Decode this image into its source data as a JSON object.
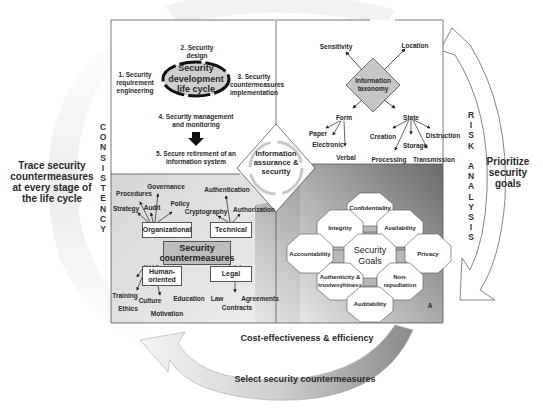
{
  "outer_arrows": {
    "left": {
      "vertical_label": "CONSISTENCY",
      "side_text": "Trace security countermeasures at every stage of the life cycle"
    },
    "right": {
      "vertical_label": "RISK ANALYSIS",
      "side_text": "Prioritize security goals"
    },
    "bottom": {
      "inner_text": "Cost-effectiveness & efficiency",
      "outer_text": "Select security countermeasures"
    }
  },
  "center": {
    "label": "Information assurance & security"
  },
  "quadrants": {
    "lifecycle": {
      "center_label": "Security development life cycle",
      "steps": [
        {
          "label": "1. Security requirement engineering"
        },
        {
          "label": "2. Security design"
        },
        {
          "label": "3. Security countermeasures implementation"
        },
        {
          "label": "4. Security management and monitoring"
        },
        {
          "label": "5. Secure retirement of an information system"
        }
      ]
    },
    "taxonomy": {
      "center_label": "Information taxonomy",
      "top": [
        "Sensitivity",
        "Location"
      ],
      "form": {
        "label": "Form",
        "children": [
          "Paper",
          "Electronic",
          "Verbal"
        ]
      },
      "state": {
        "label": "State",
        "children": [
          "Creation",
          "Processing",
          "Storage",
          "Transmission",
          "Distruction"
        ]
      }
    },
    "countermeasures": {
      "center_label": "Security countermeasures",
      "organizational": {
        "label": "Organizational",
        "children": [
          "Strategy",
          "Procedures",
          "Governance",
          "Audit",
          "Policy"
        ]
      },
      "technical": {
        "label": "Technical",
        "children": [
          "Cryptography",
          "Authentication",
          "Authorization"
        ]
      },
      "human": {
        "label": "Human-oriented",
        "children": [
          "Training",
          "Ethics",
          "Culture",
          "Motivation",
          "Education"
        ]
      },
      "legal": {
        "label": "Legal",
        "children": [
          "Law",
          "Contracts",
          "Agreements"
        ]
      }
    },
    "goals": {
      "center_label": "Security Goals",
      "items": [
        "Confidentiality",
        "Integrity",
        "Availability",
        "Accountability",
        "Privacy",
        "Authenticity & trustwoyhiness",
        "Non-repudiation",
        "Auditability"
      ],
      "stray_label": "A"
    }
  },
  "colors": {
    "gray_fill": "#c8c8c8",
    "dark_gray": "#8c8c8c",
    "line": "#555555"
  }
}
